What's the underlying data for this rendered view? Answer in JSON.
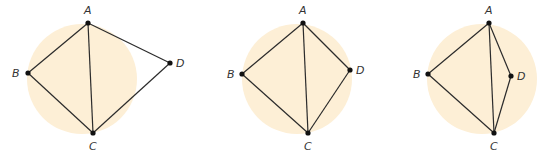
{
  "colors": {
    "circle_fill": "#fdefd6",
    "line": "#2b2b2b",
    "point": "#111111",
    "label": "#333333",
    "background": "#ffffff"
  },
  "figures": [
    {
      "name": "figure-1",
      "circle": {
        "cx": 82,
        "cy": 79,
        "r": 55
      },
      "points": {
        "A": {
          "x": 88,
          "y": 23,
          "label": "A",
          "lx": 84,
          "ly": 14
        },
        "B": {
          "x": 28,
          "y": 73,
          "label": "B",
          "lx": 12,
          "ly": 77
        },
        "C": {
          "x": 93,
          "y": 133,
          "label": "C",
          "lx": 89,
          "ly": 150
        },
        "D": {
          "x": 170,
          "y": 63,
          "label": "D",
          "lx": 176,
          "ly": 67
        }
      },
      "edges": [
        [
          "A",
          "B"
        ],
        [
          "B",
          "C"
        ],
        [
          "A",
          "C"
        ],
        [
          "A",
          "D"
        ],
        [
          "D",
          "C"
        ]
      ]
    },
    {
      "name": "figure-2",
      "circle": {
        "cx": 297,
        "cy": 79,
        "r": 55
      },
      "points": {
        "A": {
          "x": 303,
          "y": 23,
          "label": "A",
          "lx": 299,
          "ly": 14
        },
        "B": {
          "x": 242,
          "y": 74,
          "label": "B",
          "lx": 227,
          "ly": 78
        },
        "C": {
          "x": 308,
          "y": 133,
          "label": "C",
          "lx": 304,
          "ly": 150
        },
        "D": {
          "x": 350,
          "y": 70,
          "label": "D",
          "lx": 356,
          "ly": 74
        }
      },
      "edges": [
        [
          "A",
          "B"
        ],
        [
          "B",
          "C"
        ],
        [
          "A",
          "C"
        ],
        [
          "A",
          "D"
        ],
        [
          "D",
          "C"
        ]
      ]
    },
    {
      "name": "figure-3",
      "circle": {
        "cx": 482,
        "cy": 79,
        "r": 55
      },
      "points": {
        "A": {
          "x": 489,
          "y": 23,
          "label": "A",
          "lx": 485,
          "ly": 14
        },
        "B": {
          "x": 428,
          "y": 74,
          "label": "B",
          "lx": 413,
          "ly": 78
        },
        "C": {
          "x": 494,
          "y": 133,
          "label": "C",
          "lx": 490,
          "ly": 150
        },
        "D": {
          "x": 511,
          "y": 76,
          "label": "D",
          "lx": 517,
          "ly": 80
        }
      },
      "edges": [
        [
          "A",
          "B"
        ],
        [
          "B",
          "C"
        ],
        [
          "A",
          "C"
        ],
        [
          "A",
          "D"
        ],
        [
          "D",
          "C"
        ]
      ]
    }
  ]
}
